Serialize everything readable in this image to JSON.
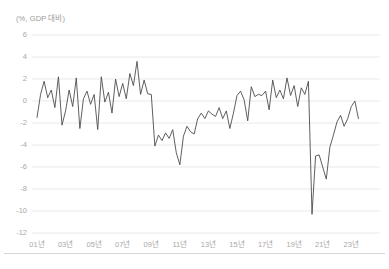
{
  "chart": {
    "unit_label": "(%, GDP 대비)",
    "axis": {
      "y_ticks": [
        "6",
        "4",
        "2",
        "0",
        "-2",
        "-4",
        "-6",
        "-8",
        "-10",
        "-12"
      ],
      "x_ticks": [
        "01년",
        "03년",
        "05년",
        "07년",
        "09년",
        "11년",
        "13년",
        "15년",
        "17년",
        "19년",
        "21년",
        "23년"
      ]
    },
    "line_color": "#4d4d4d",
    "grid_color": "#e3e3e3",
    "tick_color": "#a8a8a8"
  },
  "chart_data": {
    "type": "line",
    "title": "",
    "subtitle": "",
    "xlabel": "",
    "ylabel": "(%, GDP 대비)",
    "ylim": [
      -12,
      6
    ],
    "xlim": [
      2001.0,
      2023.75
    ],
    "grid": true,
    "legend": "none",
    "x_tick_labels": [
      "01년",
      "03년",
      "05년",
      "07년",
      "09년",
      "11년",
      "13년",
      "15년",
      "17년",
      "19년",
      "21년",
      "23년"
    ],
    "x_tick_values": [
      2001,
      2003,
      2005,
      2007,
      2009,
      2011,
      2013,
      2015,
      2017,
      2019,
      2021,
      2023
    ],
    "y_tick_values": [
      6,
      4,
      2,
      0,
      -2,
      -4,
      -6,
      -8,
      -10,
      -12
    ],
    "frequency": "quarterly",
    "series": [
      {
        "name": "관리재정수지",
        "color": "#4d4d4d",
        "x": [
          2001.0,
          2001.25,
          2001.5,
          2001.75,
          2002.0,
          2002.25,
          2002.5,
          2002.75,
          2003.0,
          2003.25,
          2003.5,
          2003.75,
          2004.0,
          2004.25,
          2004.5,
          2004.75,
          2005.0,
          2005.25,
          2005.5,
          2005.75,
          2006.0,
          2006.25,
          2006.5,
          2006.75,
          2007.0,
          2007.25,
          2007.5,
          2007.75,
          2008.0,
          2008.25,
          2008.5,
          2008.75,
          2009.0,
          2009.25,
          2009.5,
          2009.75,
          2010.0,
          2010.25,
          2010.5,
          2010.75,
          2011.0,
          2011.25,
          2011.5,
          2011.75,
          2012.0,
          2012.25,
          2012.5,
          2012.75,
          2013.0,
          2013.25,
          2013.5,
          2013.75,
          2014.0,
          2014.25,
          2014.5,
          2014.75,
          2015.0,
          2015.25,
          2015.5,
          2015.75,
          2016.0,
          2016.25,
          2016.5,
          2016.75,
          2017.0,
          2017.25,
          2017.5,
          2017.75,
          2018.0,
          2018.25,
          2018.5,
          2018.75,
          2019.0,
          2019.25,
          2019.5,
          2019.75,
          2020.0,
          2020.25,
          2020.5,
          2020.75,
          2021.0,
          2021.25,
          2021.5,
          2021.75,
          2022.0,
          2022.25,
          2022.5,
          2022.75,
          2023.0,
          2023.25,
          2023.5
        ],
        "values": [
          -1.5,
          0.6,
          1.8,
          0.3,
          1.0,
          -0.6,
          2.2,
          -2.2,
          -0.9,
          1.0,
          -0.5,
          2.1,
          -2.5,
          0.2,
          0.9,
          -0.3,
          0.6,
          -2.6,
          2.2,
          -0.1,
          0.8,
          -1.1,
          2.0,
          0.4,
          1.6,
          0.2,
          2.5,
          1.4,
          3.6,
          0.6,
          1.9,
          0.65,
          0.6,
          -4.1,
          -3.1,
          -3.6,
          -2.9,
          -3.4,
          -2.6,
          -4.7,
          -5.8,
          -3.2,
          -2.3,
          -2.8,
          -3.0,
          -1.6,
          -1.1,
          -1.6,
          -0.9,
          -1.2,
          -1.4,
          -0.6,
          -1.6,
          -0.9,
          -2.5,
          -1.1,
          0.5,
          0.9,
          0.1,
          -1.8,
          1.3,
          0.4,
          0.6,
          0.5,
          0.9,
          -0.8,
          1.9,
          0.3,
          1.0,
          0.2,
          2.1,
          0.5,
          1.4,
          -0.5,
          1.2,
          0.6,
          1.8,
          -10.3,
          -5.0,
          -4.9,
          -6.0,
          -7.1,
          -4.2,
          -3.1,
          -1.9,
          -1.3,
          -2.3,
          -1.6,
          -0.5,
          0.0,
          -1.6
        ]
      }
    ],
    "annotations": [
      {
        "label": "global-financial-crisis-trough",
        "x": 2011.0,
        "y": -5.8
      },
      {
        "label": "covid-trough",
        "x": 2020.25,
        "y": -10.3
      },
      {
        "label": "pre-gfc-peak",
        "x": 2008.0,
        "y": 3.6
      }
    ]
  }
}
